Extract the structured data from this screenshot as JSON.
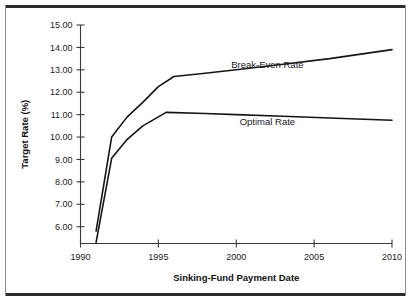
{
  "chart_data": {
    "type": "line",
    "title": "",
    "xlabel": "Sinking-Fund Payment Date",
    "ylabel": "Target Rate (%)",
    "xlim": [
      1990,
      2010
    ],
    "ylim": [
      5.25,
      15.0
    ],
    "grid": false,
    "legend_position": "inline-annotation",
    "x_ticks": [
      1990,
      1995,
      2000,
      2005,
      2010
    ],
    "x_tick_labels": [
      "1990",
      "1995",
      "2000",
      "2005",
      "2010"
    ],
    "y_ticks": [
      6.0,
      7.0,
      8.0,
      9.0,
      10.0,
      11.0,
      12.0,
      13.0,
      14.0,
      15.0
    ],
    "y_tick_labels": [
      "6.00",
      "7.00",
      "8.00",
      "9.00",
      "10.00",
      "11.00",
      "12.00",
      "13.00",
      "14.00",
      "15.00"
    ],
    "series": [
      {
        "name": "Break-Even Rate",
        "color": "#151515",
        "x": [
          1991.0,
          1992.0,
          1993.0,
          1994.0,
          1995.0,
          1996.0,
          1998.0,
          2000.0,
          2003.0,
          2006.0,
          2010.0
        ],
        "values": [
          5.8,
          10.0,
          10.9,
          11.55,
          12.25,
          12.7,
          12.85,
          13.0,
          13.25,
          13.5,
          13.9
        ]
      },
      {
        "name": "Optimal Rate",
        "color": "#151515",
        "x": [
          1991.0,
          1992.0,
          1993.0,
          1994.0,
          1995.5,
          1998.0,
          2000.0,
          2003.0,
          2006.0,
          2010.0
        ],
        "values": [
          5.3,
          9.05,
          9.9,
          10.5,
          11.1,
          11.05,
          11.0,
          10.93,
          10.85,
          10.75
        ]
      }
    ],
    "annotations": [
      {
        "text": "Break-Even Rate",
        "x": 2002.0,
        "y": 13.1
      },
      {
        "text": "Optimal Rate",
        "x": 2002.0,
        "y": 10.55
      }
    ]
  },
  "figure": {
    "background_color": "#ffffff",
    "frame_color": "#2b2b2b",
    "axis_color": "#3a3a3a"
  }
}
